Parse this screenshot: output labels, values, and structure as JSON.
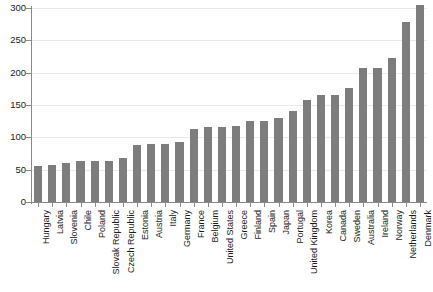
{
  "chart_data": {
    "type": "bar",
    "title": "",
    "subtitle": "",
    "xlabel": "",
    "ylabel": "",
    "ylim": [
      0,
      300
    ],
    "yticks": [
      0,
      50,
      100,
      150,
      200,
      250,
      300
    ],
    "ytick_labels": [
      "0",
      "50",
      "100",
      "150",
      "200",
      "250",
      "300"
    ],
    "grid": true,
    "legend": "none",
    "orientation": "vertical",
    "bar_color": "#7d7d7d",
    "axis_color": "#8a8a8a",
    "gridline_color": "#e9e9e9",
    "categories": [
      "Hungary",
      "Latvia",
      "Slovenia",
      "Chile",
      "Poland",
      "Slovak Republic",
      "Czech Republic",
      "Estonia",
      "Austria",
      "Italy",
      "Germany",
      "France",
      "Belgium",
      "United States",
      "Greece",
      "Finland",
      "Spain",
      "Japan",
      "Portugal",
      "United Kingdom",
      "Korea",
      "Canada",
      "Sweden",
      "Australia",
      "Ireland",
      "Norway",
      "Netherlands",
      "Denmark"
    ],
    "values": [
      55,
      57,
      60,
      63,
      63,
      64,
      68,
      88,
      90,
      90,
      93,
      113,
      116,
      116,
      117,
      125,
      125,
      130,
      140,
      157,
      165,
      165,
      177,
      207,
      207,
      222,
      278,
      305
    ]
  }
}
